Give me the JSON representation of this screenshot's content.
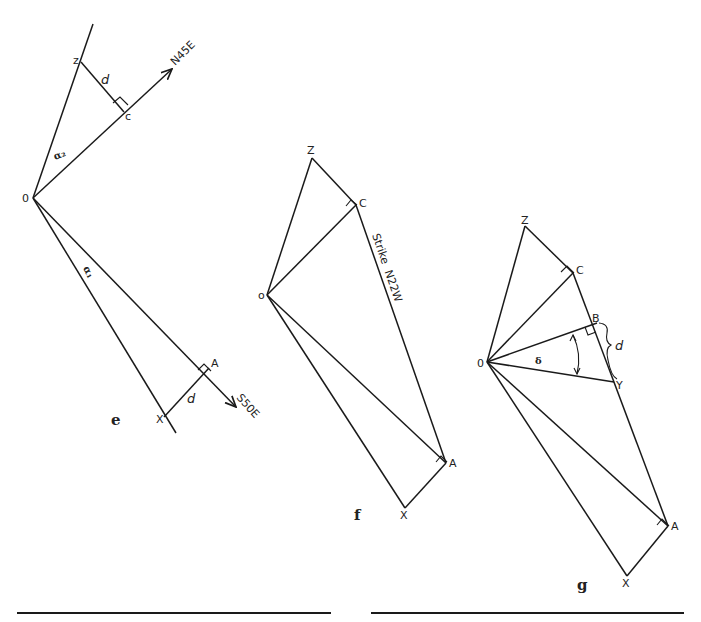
{
  "figures": {
    "e": {
      "caption": "e",
      "points": {
        "O": "0",
        "Z": "z",
        "C": "c",
        "A": "A",
        "X": "X"
      },
      "direction_labels": {
        "up": "N45E",
        "down": "S50E"
      },
      "distance_label": "d",
      "angle_labels": {
        "upper": "α₂",
        "lower": "α₁"
      }
    },
    "f": {
      "caption": "f",
      "points": {
        "O": "o",
        "Z": "Z",
        "C": "C",
        "A": "A",
        "X": "X"
      },
      "strike_label": "Strike  N22W"
    },
    "g": {
      "caption": "g",
      "points": {
        "O": "0",
        "Z": "Z",
        "C": "C",
        "B": "B",
        "Y": "Y",
        "A": "A",
        "X": "X"
      },
      "distance_label": "d",
      "angle_label": "δ"
    }
  },
  "rules": [
    "left-rule",
    "right-rule"
  ],
  "colors": {
    "ink": "#1a1a1a",
    "background": "#ffffff"
  }
}
